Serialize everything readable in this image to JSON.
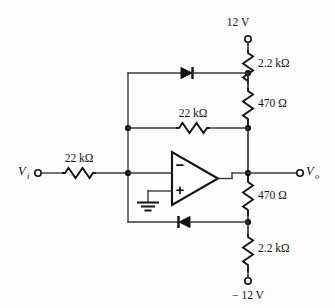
{
  "figure": {
    "background_color": "#fdfdfd",
    "line_color": "#111111"
  },
  "supplies": {
    "positive": {
      "label": "12 V",
      "terminal": "open-circle"
    },
    "negative": {
      "label": "− 12 V",
      "terminal": "open-circle"
    }
  },
  "ports": {
    "input": {
      "symbol": "V",
      "subscript": "i",
      "terminal": "open-circle"
    },
    "output": {
      "symbol": "V",
      "subscript": "o",
      "terminal": "open-circle"
    }
  },
  "components": {
    "r_input": {
      "name": "input-resistor",
      "value": "22 kΩ"
    },
    "r_feedback": {
      "name": "feedback-resistor",
      "value": "22 kΩ"
    },
    "r_top_supply": {
      "name": "upper-bias-resistor",
      "value": "2.2 kΩ"
    },
    "r_top_limit": {
      "name": "upper-limit-resistor",
      "value": "470 Ω"
    },
    "r_bottom_limit": {
      "name": "lower-limit-resistor",
      "value": "470 Ω"
    },
    "r_bottom_supply": {
      "name": "lower-bias-resistor",
      "value": "2.2 kΩ"
    },
    "d_top": {
      "name": "upper-clipping-diode",
      "orientation": "cathode-right"
    },
    "d_bottom": {
      "name": "lower-clipping-diode",
      "orientation": "cathode-left"
    },
    "opamp": {
      "name": "operational-amplifier",
      "inverting_sign": "−",
      "noninverting_sign": "+"
    },
    "ground": {
      "name": "ground-symbol"
    }
  }
}
